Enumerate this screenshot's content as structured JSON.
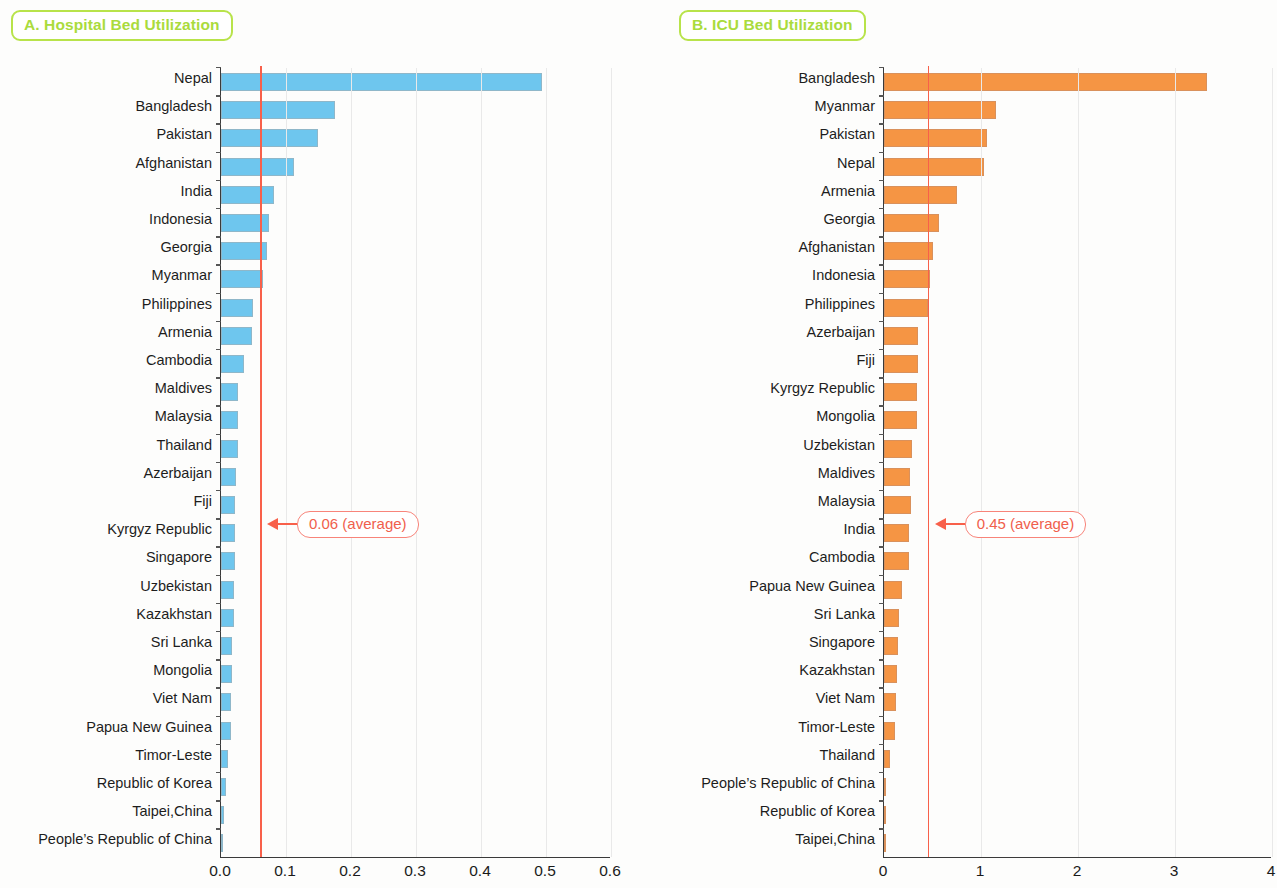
{
  "panels": {
    "a": {
      "title": "A. Hospital Bed Utilization",
      "average_label": "0.06 (average)"
    },
    "b": {
      "title": "B. ICU Bed Utilization",
      "average_label": "0.45 (average)"
    }
  },
  "colors": {
    "bar_a": "#6ec6ee",
    "bar_b": "#f59544",
    "average_line": "#f8604a",
    "title_border": "#b8e34a",
    "title_text": "#aadb3c",
    "axis": "#3a3a3a",
    "grid": "#e9e9e9"
  },
  "chart_data": [
    {
      "type": "bar",
      "orientation": "horizontal",
      "title": "A. Hospital Bed Utilization",
      "xlabel": "",
      "ylabel": "",
      "xlim": [
        0.0,
        0.6
      ],
      "xticks": [
        "0.0",
        "0.1",
        "0.2",
        "0.3",
        "0.4",
        "0.5",
        "0.6"
      ],
      "xtick_values": [
        0.0,
        0.1,
        0.2,
        0.3,
        0.4,
        0.5,
        0.6
      ],
      "grid": true,
      "legend": "none",
      "annotation": {
        "text": "0.06 (average)",
        "value": 0.06
      },
      "categories": [
        "Nepal",
        "Bangladesh",
        "Pakistan",
        "Afghanistan",
        "India",
        "Indonesia",
        "Georgia",
        "Myanmar",
        "Philippines",
        "Armenia",
        "Cambodia",
        "Maldives",
        "Malaysia",
        "Thailand",
        "Azerbaijan",
        "Fiji",
        "Kyrgyz Republic",
        "Singapore",
        "Uzbekistan",
        "Kazakhstan",
        "Sri Lanka",
        "Mongolia",
        "Viet Nam",
        "Papua New Guinea",
        "Timor-Leste",
        "Republic of Korea",
        "Taipei,China",
        "People’s Republic of China"
      ],
      "values": [
        0.494,
        0.175,
        0.149,
        0.112,
        0.082,
        0.074,
        0.071,
        0.065,
        0.049,
        0.048,
        0.035,
        0.026,
        0.026,
        0.026,
        0.023,
        0.022,
        0.022,
        0.022,
        0.02,
        0.02,
        0.017,
        0.017,
        0.016,
        0.015,
        0.011,
        0.008,
        0.005,
        0.001
      ]
    },
    {
      "type": "bar",
      "orientation": "horizontal",
      "title": "B. ICU Bed Utilization",
      "xlabel": "",
      "ylabel": "",
      "xlim": [
        0,
        4
      ],
      "xticks": [
        "0",
        "1",
        "2",
        "3",
        "4"
      ],
      "xtick_values": [
        0,
        1,
        2,
        3,
        4
      ],
      "grid": true,
      "legend": "none",
      "annotation": {
        "text": "0.45 (average)",
        "value": 0.45
      },
      "categories": [
        "Bangladesh",
        "Myanmar",
        "Pakistan",
        "Nepal",
        "Armenia",
        "Georgia",
        "Afghanistan",
        "Indonesia",
        "Philippines",
        "Azerbaijan",
        "Fiji",
        "Kyrgyz Republic",
        "Mongolia",
        "Uzbekistan",
        "Maldives",
        "Malaysia",
        "India",
        "Cambodia",
        "Papua New Guinea",
        "Sri Lanka",
        "Singapore",
        "Kazakhstan",
        "Viet Nam",
        "Timor-Leste",
        "Thailand",
        "People’s Republic of China",
        "Republic of Korea",
        "Taipei,China"
      ],
      "values": [
        3.33,
        1.15,
        1.06,
        1.03,
        0.75,
        0.57,
        0.51,
        0.47,
        0.45,
        0.35,
        0.35,
        0.34,
        0.34,
        0.29,
        0.27,
        0.28,
        0.26,
        0.26,
        0.19,
        0.15,
        0.14,
        0.13,
        0.12,
        0.11,
        0.06,
        0.02,
        0.01,
        0.004
      ]
    }
  ]
}
